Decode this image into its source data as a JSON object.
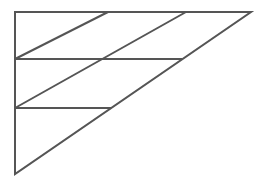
{
  "diagram": {
    "type": "geometric-line-figure",
    "stroke_color": "#555555",
    "background": "#ffffff",
    "stroke_width": 2,
    "outer_triangle": {
      "vertices": [
        [
          15,
          12
        ],
        [
          251,
          12
        ],
        [
          15,
          174
        ]
      ]
    },
    "horizontal_lines": [
      {
        "y": 59,
        "x1": 15,
        "x2": 182
      },
      {
        "y": 108,
        "x1": 15,
        "x2": 111
      }
    ],
    "diagonal_lines": [
      {
        "x1": 108,
        "y1": 12,
        "x2": 15,
        "y2": 59
      },
      {
        "x1": 186,
        "y1": 12,
        "x2": 15,
        "y2": 108
      }
    ]
  }
}
